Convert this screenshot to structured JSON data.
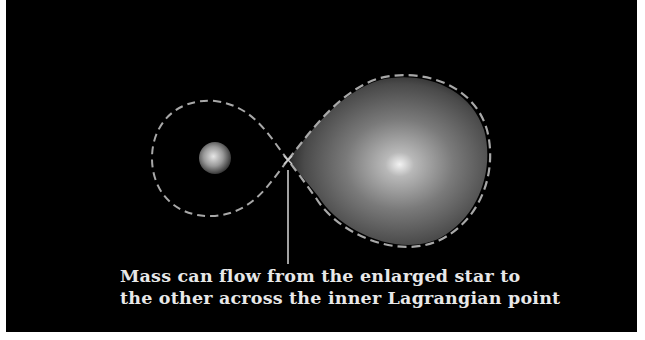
{
  "figure": {
    "caption": {
      "line1": "Mass can flow from the enlarged star to",
      "line2": "the other across the inner Lagrangian point"
    },
    "elements": {
      "small_star": "compact companion star inside its Roche lobe",
      "large_star": "enlarged star filling its Roche lobe",
      "roche_lobes": "dashed figure-eight equipotential surface",
      "lagrangian_point": "inner Lagrangian point (L1)",
      "pointer_line": "leader line from caption to L1"
    },
    "colors": {
      "background": "#000000",
      "border": "#ffffff",
      "dash": "#a8a8a8",
      "text": "#e8e8e8",
      "star_core": "#f0f0f0"
    }
  }
}
